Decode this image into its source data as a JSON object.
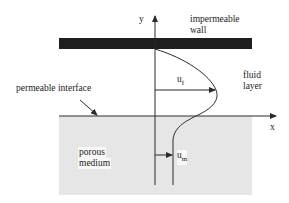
{
  "diagram": {
    "axes": {
      "y_label": "y",
      "x_label": "x"
    },
    "labels": {
      "wall_line1": "impermeable",
      "wall_line2": "wall",
      "fluid_line1": "fluid",
      "fluid_line2": "layer",
      "interface": "permeable interface",
      "porous_line1": "porous",
      "porous_line2": "medium",
      "uf_base": "u",
      "uf_sub": "f",
      "um_base": "u",
      "um_sub": "m"
    },
    "colors": {
      "wall": "#1e1e1e",
      "porous_fill": "#e6e6e6",
      "line": "#2a2a2a",
      "background": "#ffffff"
    }
  }
}
